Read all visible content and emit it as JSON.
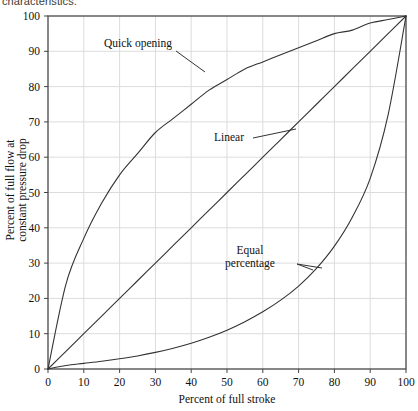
{
  "caption": {
    "cut_text": "characteristics."
  },
  "chart_data": {
    "type": "line",
    "title": "",
    "xlabel": "Percent of full stroke",
    "ylabel": "Percent of full flow at constant pressure drop",
    "ylabel_line1": "Percent of full flow at",
    "ylabel_line2": "constant pressure drop",
    "xlim": [
      0,
      100
    ],
    "ylim": [
      0,
      100
    ],
    "xticks": [
      0,
      10,
      20,
      30,
      40,
      50,
      60,
      70,
      80,
      90,
      100
    ],
    "yticks": [
      0,
      10,
      20,
      30,
      40,
      50,
      60,
      70,
      80,
      90,
      100
    ],
    "xtick_labels": [
      "0",
      "10",
      "20",
      "30",
      "40",
      "50",
      "60",
      "70",
      "80",
      "90",
      "100"
    ],
    "ytick_labels": [
      "0",
      "10",
      "20",
      "30",
      "40",
      "50",
      "60",
      "70",
      "80",
      "90",
      "100"
    ],
    "grid": true,
    "grid_color": "#dcdcdc",
    "legend": "none",
    "line_color": "#333333",
    "x": [
      0,
      5,
      10,
      15,
      20,
      25,
      30,
      35,
      40,
      45,
      50,
      55,
      60,
      65,
      70,
      75,
      80,
      85,
      90,
      95,
      100
    ],
    "series": [
      {
        "name": "Quick opening",
        "label": "Quick opening",
        "values": [
          0,
          24,
          37,
          47,
          55,
          61,
          67,
          71,
          75,
          79,
          82,
          85,
          87,
          89,
          91,
          93,
          95,
          96,
          98,
          99,
          100
        ]
      },
      {
        "name": "Linear",
        "label": "Linear",
        "values": [
          0,
          5,
          10,
          15,
          20,
          25,
          30,
          35,
          40,
          45,
          50,
          55,
          60,
          65,
          70,
          75,
          80,
          85,
          90,
          95,
          100
        ]
      },
      {
        "name": "Equal percentage",
        "label_line1": "Equal",
        "label_line2": "percentage",
        "values": [
          0,
          1.0,
          1.6,
          2.2,
          2.9,
          3.7,
          4.7,
          5.9,
          7.3,
          9.0,
          11.0,
          13.4,
          16.2,
          19.5,
          23.5,
          28.5,
          34.8,
          43.0,
          54.0,
          72.0,
          100
        ]
      }
    ],
    "annotations": [
      {
        "text": "Quick opening",
        "text_x": 104,
        "text_y": 47,
        "leader": [
          [
            176,
            51
          ],
          [
            205,
            72
          ]
        ]
      },
      {
        "text": "Linear",
        "text_x": 214,
        "text_y": 141,
        "leader": [
          [
            253,
            138
          ],
          [
            296,
            129
          ]
        ]
      },
      {
        "text": "Equal percentage",
        "text_x": 250,
        "text_y": 254,
        "leader": [
          [
            297,
            264
          ],
          [
            322,
            268
          ]
        ]
      }
    ]
  }
}
